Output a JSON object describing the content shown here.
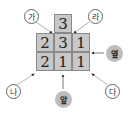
{
  "diagram": {
    "top_cell": "3",
    "rows": [
      [
        "2",
        "3",
        "1"
      ],
      [
        "2",
        "1",
        "1"
      ]
    ],
    "view_labels": {
      "ga": "가",
      "ra": "라",
      "na": "나",
      "da": "다"
    },
    "direction_labels": {
      "front": "앞",
      "side": "옆"
    },
    "colors": {
      "cell_fill": "#c8c8c8",
      "cell_border": "#8a8a8a",
      "filled_label": "#bdbdbd"
    }
  }
}
